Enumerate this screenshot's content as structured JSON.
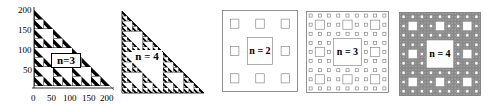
{
  "figure": {
    "panels": [
      {
        "id": "triangle-n3",
        "type": "sierpinski-triangle",
        "label": "n=3",
        "level": 3,
        "axes": {
          "x_ticks": [
            "0",
            "50",
            "100",
            "150",
            "200"
          ],
          "y_ticks": [
            "50",
            "100",
            "150",
            "200"
          ]
        }
      },
      {
        "id": "triangle-n4",
        "type": "sierpinski-triangle",
        "label": "n = 4",
        "level": 4
      },
      {
        "id": "carpet-n2",
        "type": "sierpinski-carpet",
        "label": "n = 2",
        "level": 2
      },
      {
        "id": "carpet-n3",
        "type": "sierpinski-carpet",
        "label": "n = 3",
        "level": 3
      },
      {
        "id": "carpet-n4",
        "type": "sierpinski-carpet",
        "label": "n = 4",
        "level": 4
      }
    ]
  },
  "colors": {
    "fill": "#000000",
    "line": "#555555",
    "background": "#ffffff",
    "carpet_dense": "#7a7a7a"
  }
}
